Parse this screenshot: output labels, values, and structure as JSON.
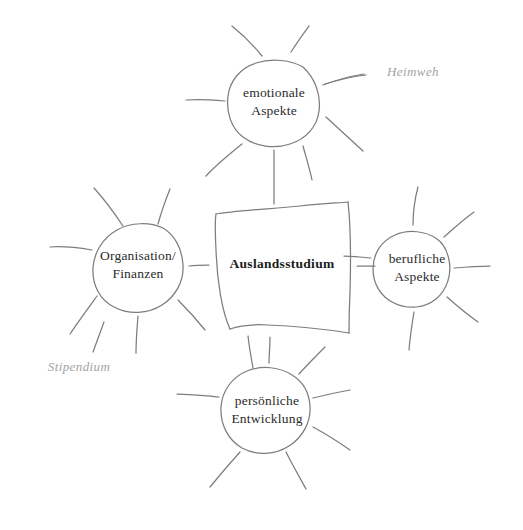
{
  "diagram": {
    "background_color": "#ffffff",
    "stroke_color": "#7d7d7d",
    "text_color": "#2b2b2b",
    "annotation_color": "#a3a3a3",
    "center": {
      "label": "Auslandsstudium",
      "shape": "hand-drawn-rectangle",
      "x": 282,
      "y": 264
    },
    "nodes": [
      {
        "id": "emotionale",
        "label": "emotionale\nAspekte",
        "shape": "hand-drawn-circle",
        "x": 274,
        "y": 102,
        "r": 46
      },
      {
        "id": "organisation",
        "label": "Organisation/\nFinanzen",
        "shape": "hand-drawn-circle",
        "x": 138,
        "y": 265,
        "r": 47
      },
      {
        "id": "berufliche",
        "label": "berufliche\nAspekte",
        "shape": "hand-drawn-circle",
        "x": 417,
        "y": 268,
        "r": 43
      },
      {
        "id": "persoenliche",
        "label": "persönliche\nEntwicklung",
        "shape": "hand-drawn-circle",
        "x": 267,
        "y": 410,
        "r": 47
      }
    ],
    "annotations": [
      {
        "id": "heimweh",
        "label": "Heimweh",
        "x": 413,
        "y": 72
      },
      {
        "id": "stipendium",
        "label": "Stipendium",
        "x": 79,
        "y": 367
      }
    ]
  }
}
